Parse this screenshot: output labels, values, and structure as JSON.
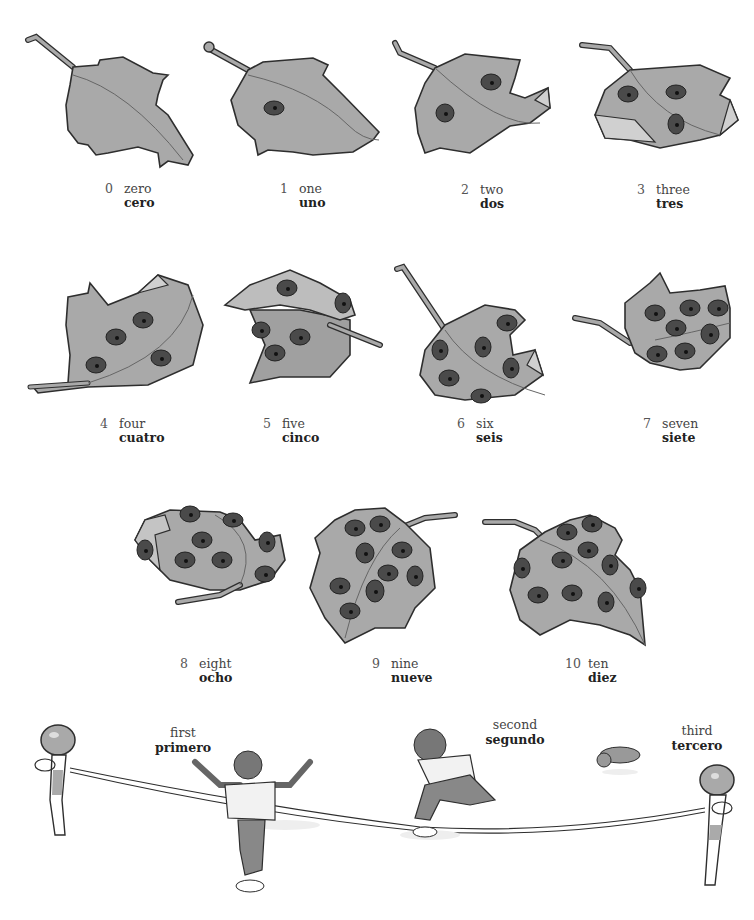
{
  "numbers": [
    {
      "digit": "0",
      "english": "zero",
      "spanish": "cero",
      "ladybugs": 0
    },
    {
      "digit": "1",
      "english": "one",
      "spanish": "uno",
      "ladybugs": 1
    },
    {
      "digit": "2",
      "english": "two",
      "spanish": "dos",
      "ladybugs": 2
    },
    {
      "digit": "3",
      "english": "three",
      "spanish": "tres",
      "ladybugs": 3
    },
    {
      "digit": "4",
      "english": "four",
      "spanish": "cuatro",
      "ladybugs": 4
    },
    {
      "digit": "5",
      "english": "five",
      "spanish": "cinco",
      "ladybugs": 5
    },
    {
      "digit": "6",
      "english": "six",
      "spanish": "seis",
      "ladybugs": 6
    },
    {
      "digit": "7",
      "english": "seven",
      "spanish": "siete",
      "ladybugs": 7
    },
    {
      "digit": "8",
      "english": "eight",
      "spanish": "ocho",
      "ladybugs": 8
    },
    {
      "digit": "9",
      "english": "nine",
      "spanish": "nueve",
      "ladybugs": 9
    },
    {
      "digit": "10",
      "english": "ten",
      "spanish": "diez",
      "ladybugs": 10
    }
  ],
  "ordinals": [
    {
      "english": "first",
      "spanish": "primero"
    },
    {
      "english": "second",
      "spanish": "segundo"
    },
    {
      "english": "third",
      "spanish": "tercero"
    }
  ],
  "colors": {
    "leaf_fill": "#a9a9a9",
    "leaf_outline": "#2e2e2e",
    "ladybug": "#4a4a4a",
    "background": "#ffffff"
  }
}
